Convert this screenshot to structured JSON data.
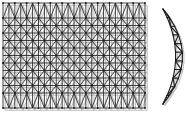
{
  "figure": {
    "background_color": "#ffffff",
    "line_color": "#222222",
    "shadow_color": "#bdbdbd",
    "width": 187,
    "height": 114,
    "panels": [
      {
        "name": "flat-grid-truss-panel",
        "description": "Rectangular double-layer space frame grid shown in plan, square bays with full X diagonal bracing, zigzag chord rows top and bottom",
        "view": "plan",
        "x": 3,
        "y": 3,
        "width": 142,
        "height": 105,
        "columns": 12,
        "rows": 7,
        "cell_width": 11.833,
        "cell_height": 15.0,
        "bracing": "cross-diagonal",
        "edge_pattern": "zigzag",
        "node_marker": "filled-dot"
      },
      {
        "name": "curved-arch-truss-panel",
        "description": "Crescent / bow shaped curved arch truss with straight chord and alternating triangular web members",
        "view": "elevation",
        "x": 152,
        "y": 7,
        "width": 33,
        "height": 99,
        "top_point": [
          163,
          9
        ],
        "bottom_point": [
          163,
          104
        ],
        "outer_apex": [
          183,
          57
        ],
        "inner_apex": [
          176,
          57
        ],
        "web_panels": 11,
        "web_pattern": "alternating-triangles",
        "node_marker": "none"
      }
    ]
  },
  "chart_data": {
    "type": "diagram",
    "elements": [
      {
        "id": "flat-grid",
        "label": "Flat rectangular space-frame grid",
        "shape": "rectangular-lattice",
        "grid_columns": 12,
        "grid_rows": 7,
        "member_types": [
          "top chord",
          "bottom chord",
          "diagonal brace",
          "vertical post"
        ],
        "bbox": [
          3,
          3,
          145,
          108
        ]
      },
      {
        "id": "curved-arch",
        "label": "Curved crescent arch truss",
        "shape": "lens-crescent",
        "web_panels": 11,
        "member_types": [
          "curved outer chord",
          "straight inner chord",
          "diagonal web"
        ],
        "bbox": [
          152,
          7,
          185,
          106
        ]
      }
    ],
    "legend": [],
    "annotations": []
  }
}
